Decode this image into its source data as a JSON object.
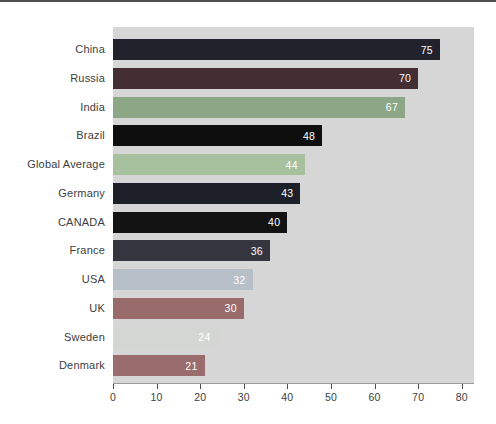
{
  "page": {
    "background": "#ffffff",
    "top_border_color": "#4f4f4f"
  },
  "chart_data": {
    "type": "bar",
    "orientation": "horizontal",
    "title": "",
    "categories": [
      "China",
      "Russia",
      "India",
      "Brazil",
      "Global Average",
      "Germany",
      "CANADA",
      "France",
      "USA",
      "UK",
      "Sweden",
      "Denmark"
    ],
    "values": [
      75,
      70,
      67,
      48,
      44,
      43,
      40,
      36,
      32,
      30,
      24,
      21
    ],
    "bar_colors": [
      "#22222c",
      "#432f33",
      "#8ca686",
      "#0e0e0e",
      "#a7c19e",
      "#1d1f29",
      "#131313",
      "#35353f",
      "#b7c0c9",
      "#996b6b",
      "#d4d6d3",
      "#9a6c6d"
    ],
    "value_label_color": "#ffffff",
    "category_label_color": "#3d3d3d",
    "axis_text_color": "#3d3d3d",
    "x_ticks": [
      "0",
      "10",
      "20",
      "30",
      "40",
      "50",
      "60",
      "70",
      "80"
    ],
    "xlim": [
      0,
      80
    ],
    "plot_background": "#d6d6d6",
    "grid": false,
    "legend": "none",
    "xlabel": "",
    "ylabel": ""
  }
}
